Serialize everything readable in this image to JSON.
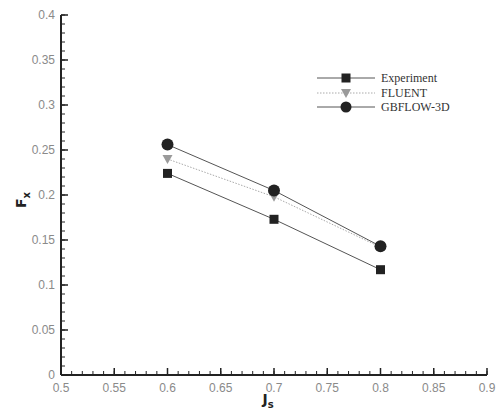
{
  "chart_data": {
    "type": "line",
    "title": "",
    "xlabel": "J",
    "xlabel_sub": "s",
    "ylabel": "F",
    "ylabel_sub": "x",
    "xlim": [
      0.5,
      0.9
    ],
    "ylim": [
      0,
      0.4
    ],
    "xticks": [
      "0.5",
      "0.55",
      "0.6",
      "0.65",
      "0.7",
      "0.75",
      "0.8",
      "0.85",
      "0.9"
    ],
    "yticks": [
      "0",
      "0.05",
      "0.1",
      "0.15",
      "0.2",
      "0.25",
      "0.3",
      "0.35",
      "0.4"
    ],
    "grid": false,
    "legend_position": "upper right (inside)",
    "x": [
      0.6,
      0.7,
      0.8
    ],
    "series": [
      {
        "name": "Experiment",
        "marker": "square",
        "line": "solid",
        "color": "#333333",
        "values": [
          0.224,
          0.173,
          0.117
        ]
      },
      {
        "name": "FLUENT",
        "marker": "triangle-down",
        "line": "dotted",
        "color": "#999999",
        "values": [
          0.24,
          0.198,
          0.142
        ]
      },
      {
        "name": "GBFLOW-3D",
        "marker": "circle",
        "line": "solid",
        "color": "#333333",
        "values": [
          0.256,
          0.205,
          0.143
        ]
      }
    ]
  }
}
